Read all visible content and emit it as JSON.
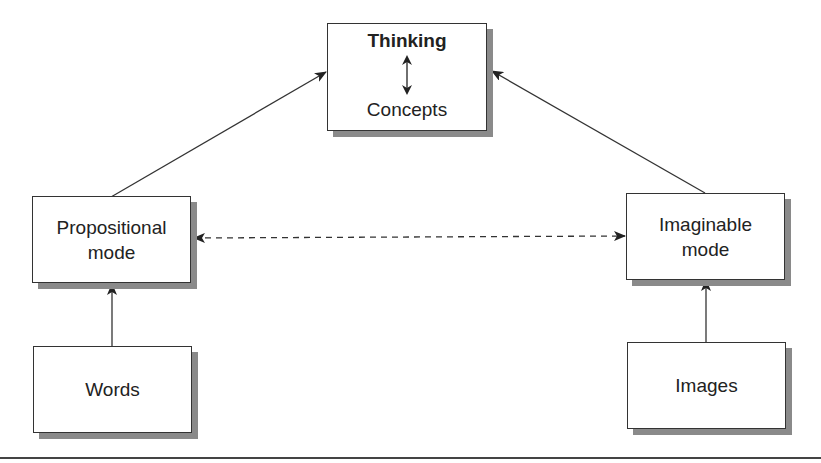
{
  "diagram": {
    "nodes": {
      "top": {
        "title": "Thinking",
        "subtitle": "Concepts"
      },
      "propositional": {
        "line1": "Propositional",
        "line2": "mode"
      },
      "imaginable": {
        "line1": "Imaginable",
        "line2": "mode"
      },
      "words": {
        "label": "Words"
      },
      "images": {
        "label": "Images"
      }
    },
    "edges": [
      {
        "from": "propositional",
        "to": "top",
        "style": "solid"
      },
      {
        "from": "imaginable",
        "to": "top",
        "style": "solid"
      },
      {
        "from": "words",
        "to": "propositional",
        "style": "solid"
      },
      {
        "from": "images",
        "to": "imaginable",
        "style": "solid"
      },
      {
        "from": "propositional",
        "to": "imaginable",
        "style": "dashed",
        "bidirectional": true
      },
      {
        "from": "Thinking",
        "to": "Concepts",
        "style": "solid",
        "bidirectional": true
      }
    ],
    "colors": {
      "stroke": "#333333",
      "shadow": "#8a8a8a",
      "background": "#ffffff"
    }
  }
}
